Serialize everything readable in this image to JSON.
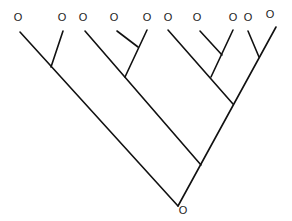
{
  "diagram": {
    "type": "tree",
    "leaf_symbol": "O",
    "root_label": "O",
    "leaves": [
      {
        "id": "L1",
        "label": "O",
        "x": 18,
        "y": 21
      },
      {
        "id": "L2",
        "label": "O",
        "x": 62,
        "y": 21
      },
      {
        "id": "L3",
        "label": "O",
        "x": 83,
        "y": 21
      },
      {
        "id": "L4",
        "label": "O",
        "x": 114,
        "y": 21
      },
      {
        "id": "L5",
        "label": "O",
        "x": 147,
        "y": 21
      },
      {
        "id": "L6",
        "label": "O",
        "x": 168,
        "y": 21
      },
      {
        "id": "L7",
        "label": "O",
        "x": 197,
        "y": 21
      },
      {
        "id": "L8",
        "label": "O",
        "x": 233,
        "y": 21
      },
      {
        "id": "L9",
        "label": "O",
        "x": 248,
        "y": 21
      },
      {
        "id": "L10",
        "label": "O",
        "x": 270,
        "y": 18
      }
    ],
    "root": {
      "label": "O",
      "x": 183,
      "y": 214
    },
    "stroke_color": "#111111",
    "background_color": "#ffffff"
  }
}
